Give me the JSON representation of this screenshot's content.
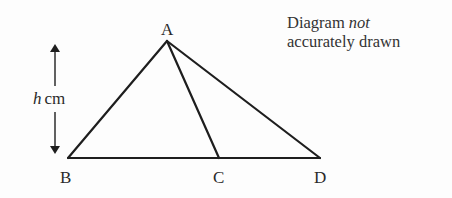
{
  "diagram": {
    "type": "geometry-triangle",
    "vertices": {
      "A": {
        "label": "A",
        "x": 167,
        "y": 41
      },
      "B": {
        "label": "B",
        "x": 68,
        "y": 158
      },
      "C": {
        "label": "C",
        "x": 219,
        "y": 158
      },
      "D": {
        "label": "D",
        "x": 320,
        "y": 158
      }
    },
    "segments": [
      {
        "from": "A",
        "to": "B"
      },
      {
        "from": "A",
        "to": "C"
      },
      {
        "from": "A",
        "to": "D"
      },
      {
        "from": "B",
        "to": "D"
      }
    ],
    "height": {
      "variable": "h",
      "unit": "cm",
      "arrow": "double-headed vertical"
    },
    "note": {
      "prefix": "Diagram ",
      "emphasis": "not",
      "line2": "accurately drawn"
    },
    "colors": {
      "stroke": "#1e1e1e",
      "text": "#2a2a2a",
      "background": "#fdfdfd"
    }
  }
}
